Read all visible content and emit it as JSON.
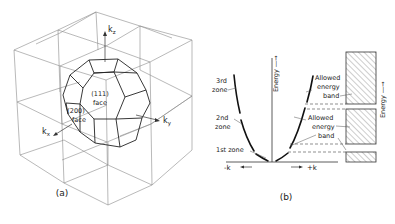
{
  "figure": {
    "panel_a": {
      "caption": "(a)",
      "axes": {
        "kz": "k",
        "kz_sub": "z",
        "ky": "k",
        "ky_sub": "y",
        "kx": "k",
        "kx_sub": "x"
      },
      "faces": [
        {
          "line1": "(111)",
          "line2": "face"
        },
        {
          "line1": "(200)",
          "line2": "face"
        }
      ]
    },
    "panel_b": {
      "caption": "(b)",
      "energy_axis_label": "Energy —→",
      "band_axis_label": "Energy —→",
      "k_neg": "-k",
      "k_pos": "+k",
      "zones": [
        {
          "line1": "3rd",
          "line2": "zone"
        },
        {
          "line1": "2nd",
          "line2": "zone"
        },
        {
          "line1": "1st zone",
          "line2": ""
        }
      ],
      "bands": [
        {
          "line1": "Allowed",
          "line2": "energy",
          "line3": "band"
        },
        {
          "line1": "Allowed",
          "line2": "energy",
          "line3": "band"
        }
      ]
    },
    "colors": {
      "line": "#222222",
      "grid": "#8a8a8a",
      "background": "#ffffff"
    }
  }
}
